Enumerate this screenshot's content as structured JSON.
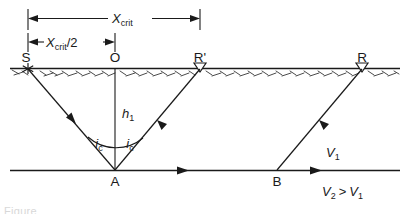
{
  "figure": {
    "type": "seismic-refraction-raypath-diagram",
    "caption_partial": "Figure",
    "dimensions": [
      {
        "id": "x-crit",
        "label_main": "X",
        "label_sub": "crit",
        "label_suffix": "",
        "from_point": "S",
        "to_point": "R'"
      },
      {
        "id": "x-crit-half",
        "label_main": "X",
        "label_sub": "crit",
        "label_suffix": "/2",
        "from_point": "S",
        "to_point": "O"
      }
    ],
    "surface_points": [
      {
        "id": "S",
        "label": "S",
        "marker": "source-star-icon",
        "x": 28
      },
      {
        "id": "O",
        "label": "O",
        "marker": "none",
        "x": 115
      },
      {
        "id": "R-prime",
        "label": "R'",
        "marker": "geophone-triangle-icon",
        "x": 200
      },
      {
        "id": "R",
        "label": "R",
        "marker": "geophone-triangle-icon",
        "x": 362
      }
    ],
    "interface_points": [
      {
        "id": "A",
        "label": "A",
        "x": 115
      },
      {
        "id": "B",
        "label": "B",
        "x": 277
      }
    ],
    "depth": {
      "label_main": "h",
      "label_sub": "1"
    },
    "angles": [
      {
        "id": "ic-left",
        "label_main": "i",
        "label_sub": "c"
      },
      {
        "id": "ic-right",
        "label_main": "i",
        "label_sub": "c"
      }
    ],
    "velocities": {
      "upper_layer": {
        "label_main": "V",
        "label_sub": "1"
      },
      "relation": {
        "v2_main": "V",
        "v2_sub": "2",
        "operator": ">",
        "v1_main": "V",
        "v1_sub": "1"
      }
    },
    "colors": {
      "ink": "#1a1a1a",
      "hatch": "#2b2b2b",
      "background": "#ffffff"
    }
  }
}
